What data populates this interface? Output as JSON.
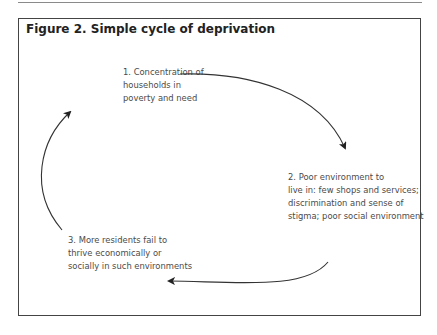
{
  "figure": {
    "title": "Figure 2. Simple cycle of deprivation",
    "nodes": [
      {
        "id": 1,
        "text": "1. Concentration of\nhouseholds in\npoverty and need"
      },
      {
        "id": 2,
        "text": "2. Poor environment to\nlive in: few shops and services;\ndiscrimination and sense of\nstigma; poor social environment"
      },
      {
        "id": 3,
        "text": "3. More residents fail to\nthrive economically or\nsocially in such environments"
      }
    ],
    "edges": [
      {
        "from": 1,
        "to": 2
      },
      {
        "from": 2,
        "to": 3
      },
      {
        "from": 3,
        "to": 1
      }
    ]
  }
}
